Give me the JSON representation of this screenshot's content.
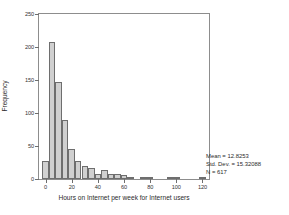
{
  "chart_data": {
    "type": "bar",
    "title": "",
    "subtitle": "",
    "xlabel": "Hours on Internet per week for Internet users",
    "ylabel": "Frequency",
    "xlim": [
      -5,
      125
    ],
    "ylim": [
      0,
      250
    ],
    "grid": false,
    "legend": null,
    "bin_width": 5,
    "xticks": [
      0,
      20,
      40,
      60,
      80,
      100,
      120
    ],
    "xtick_labels": [
      "0",
      "20",
      "40",
      "60",
      "80",
      "100",
      "120"
    ],
    "yticks": [
      0,
      50,
      100,
      150,
      200,
      250
    ],
    "ytick_labels": [
      "0",
      "50",
      "100",
      "150",
      "200",
      "250"
    ],
    "bin_centers": [
      0,
      5,
      10,
      15,
      20,
      25,
      30,
      35,
      40,
      45,
      50,
      55,
      60,
      65,
      70,
      75,
      80,
      85,
      90,
      95,
      100,
      105,
      110,
      115,
      120
    ],
    "values": [
      28,
      208,
      147,
      90,
      46,
      28,
      19,
      17,
      8,
      14,
      8,
      7,
      6,
      1,
      0,
      2,
      1,
      0,
      0,
      2,
      1,
      0,
      0,
      0,
      1
    ],
    "categories": [
      "0",
      "5",
      "10",
      "15",
      "20",
      "25",
      "30",
      "35",
      "40",
      "45",
      "50",
      "55",
      "60",
      "65",
      "70",
      "75",
      "80",
      "85",
      "90",
      "95",
      "100",
      "105",
      "110",
      "115",
      "120"
    ],
    "bar_color": "#d0d0d0",
    "bar_edge_color": "#6e6e6e",
    "frame_color": "#8d8d8d",
    "annotations": {
      "mean_label": "Mean = 12.8253",
      "std_dev_label": "Std. Dev. = 15.32088",
      "n_label": "N = 617",
      "position": "bottom-right"
    }
  },
  "stats": {
    "mean": "Mean = 12.8253",
    "std_dev": "Std. Dev. = 15.32088",
    "n": "N = 617"
  }
}
